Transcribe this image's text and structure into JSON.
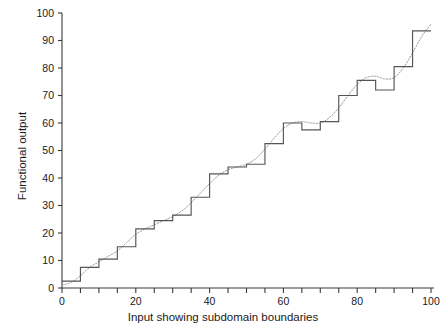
{
  "chart_data": {
    "type": "line",
    "title": "",
    "xlabel": "Input showing subdomain boundaries",
    "ylabel": "Functional output",
    "xlim": [
      0,
      100
    ],
    "ylim": [
      0,
      100
    ],
    "grid": false,
    "legend_position": "none",
    "x_ticks_major": [
      0,
      20,
      40,
      60,
      80,
      100
    ],
    "x_ticks_minor": [
      5,
      10,
      15,
      25,
      30,
      35,
      45,
      50,
      55,
      65,
      70,
      75,
      85,
      90,
      95
    ],
    "x_tick_labels": [
      "0",
      "20",
      "40",
      "60",
      "80",
      "100"
    ],
    "y_ticks": [
      0,
      10,
      20,
      30,
      40,
      50,
      60,
      70,
      80,
      90,
      100
    ],
    "y_tick_labels": [
      "0",
      "10",
      "20",
      "30",
      "40",
      "50",
      "60",
      "70",
      "80",
      "90",
      "100"
    ],
    "subdomain_width": 5,
    "series": [
      {
        "name": "Step function over subdomains",
        "style": "solid-step",
        "color": "#555555",
        "step_edges": [
          0,
          5,
          10,
          15,
          20,
          25,
          30,
          35,
          40,
          45,
          50,
          55,
          60,
          65,
          70,
          75,
          80,
          85,
          90,
          95,
          100
        ],
        "values": [
          2.5,
          7.5,
          10.5,
          15.0,
          21.5,
          24.5,
          26.5,
          33.0,
          41.5,
          44.0,
          45.0,
          52.5,
          60.0,
          57.5,
          60.5,
          70.0,
          75.5,
          72.0,
          80.5,
          93.5
        ]
      },
      {
        "name": "Underlying smooth response",
        "style": "dotted",
        "color": "#999999",
        "x": [
          0,
          2.5,
          5,
          7.5,
          10,
          12.5,
          15,
          17.5,
          20,
          22.5,
          25,
          27.5,
          30,
          32.5,
          35,
          37.5,
          40,
          42.5,
          45,
          47.5,
          50,
          52.5,
          55,
          57.5,
          60,
          62.5,
          65,
          67.5,
          70,
          72.5,
          75,
          77.5,
          80,
          82.5,
          85,
          87.5,
          90,
          92.5,
          95,
          97.5,
          100
        ],
        "y": [
          1.0,
          2.0,
          4.5,
          7.5,
          9.5,
          11.5,
          13.5,
          16.5,
          19.5,
          21.5,
          23.0,
          24.5,
          26.0,
          28.0,
          31.0,
          34.5,
          38.0,
          41.0,
          43.0,
          44.0,
          45.0,
          47.0,
          50.5,
          54.5,
          58.0,
          60.0,
          60.5,
          60.0,
          60.0,
          62.0,
          65.5,
          70.0,
          74.0,
          76.5,
          77.0,
          76.0,
          76.5,
          80.0,
          85.5,
          91.5,
          96.0
        ]
      }
    ]
  }
}
